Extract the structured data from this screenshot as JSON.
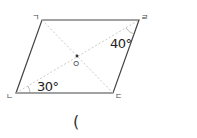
{
  "figure": {
    "shape": "parallelogram",
    "vertices": {
      "top_left": {
        "label": "ㄱ",
        "x": 42,
        "y": 20
      },
      "top_right": {
        "label": "ㄹ",
        "x": 139,
        "y": 20
      },
      "bottom_right": {
        "label": "ㄷ",
        "x": 113,
        "y": 93
      },
      "bottom_left": {
        "label": "ㄴ",
        "x": 16,
        "y": 93
      }
    },
    "center": {
      "label": "ㅇ",
      "x": 77,
      "y": 56
    },
    "angles": [
      {
        "value": "30°",
        "at": "ㄴ"
      },
      {
        "value": "40°",
        "at": "ㄹ"
      }
    ],
    "diagonals": "dashed",
    "colors": {
      "edge": "#444444",
      "diagonal": "#bbbbbb",
      "text": "#222222"
    }
  },
  "answer": {
    "open_paren": "("
  },
  "top_text_cut": "· · ·"
}
